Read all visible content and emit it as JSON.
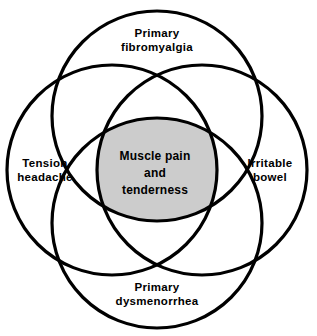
{
  "diagram": {
    "type": "four-set-venn-diagram",
    "title": "",
    "canvas": {
      "width": 317,
      "height": 336,
      "background": "#ffffff"
    },
    "style": {
      "stroke_color": "#000000",
      "stroke_width": 3.2,
      "intersection_fill": "#cccccc",
      "text_color": "#000000"
    },
    "sets": [
      {
        "id": "primary-fibromyalgia",
        "position": "top",
        "label_lines": [
          "Primary",
          "fibromyalgia"
        ],
        "cx": 157,
        "cy": 116,
        "r": 105
      },
      {
        "id": "tension-headache",
        "position": "left",
        "label_lines": [
          "Tension",
          "headache"
        ],
        "cx": 112,
        "cy": 170,
        "r": 105
      },
      {
        "id": "irritable-bowel",
        "position": "right",
        "label_lines": [
          "Irritable",
          "bowel"
        ],
        "cx": 202,
        "cy": 170,
        "r": 105
      },
      {
        "id": "primary-dysmenorrhea",
        "position": "bottom",
        "label_lines": [
          "Primary",
          "dysmenorrhea"
        ],
        "cx": 157,
        "cy": 223,
        "r": 105
      }
    ],
    "intersection": {
      "id": "muscle-pain-and-tenderness",
      "label_lines": [
        "Muscle pain",
        "and",
        "tenderness"
      ],
      "fill": "#cccccc",
      "cx": 155,
      "cy": 170
    },
    "labels": {
      "top_line1": "Primary",
      "top_line2": "fibromyalgia",
      "left_line1": "Tension",
      "left_line2": "headache",
      "right_line1": "Irritable",
      "right_line2": "bowel",
      "bottom_line1": "Primary",
      "bottom_line2": "dysmenorrhea",
      "center_line1": "Muscle pain",
      "center_line2": "and",
      "center_line3": "tenderness"
    }
  }
}
